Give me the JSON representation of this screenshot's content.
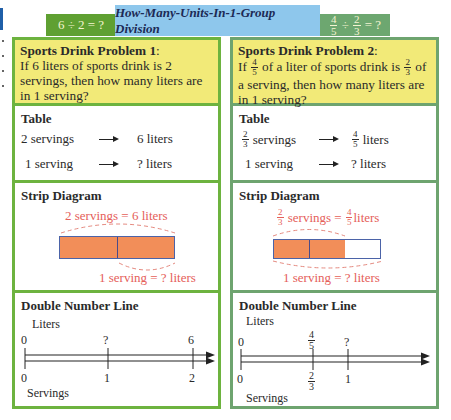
{
  "header": {
    "left_equation": "6 ÷ 2 = ?",
    "title": "How-Many-Units-In-1-Group Division",
    "right_equation": {
      "a_num": "4",
      "a_den": "5",
      "op": "÷",
      "b_num": "2",
      "b_den": "3",
      "tail": "= ?"
    }
  },
  "colors": {
    "left_green": "#5fa032",
    "title_blue": "#8ec7ec",
    "right_green": "#6da770",
    "problem_yellow": "#f2ea78",
    "strip_fill": "#f28e59",
    "label_red": "#e5605a"
  },
  "problem1": {
    "heading": "Sports Drink Problem 1",
    "heading_colon": ":",
    "text": "If 6 liters of sports drink is 2 servings, then how many liters are in 1 serving?",
    "table": {
      "title": "Table",
      "rows": [
        {
          "left": "2 servings",
          "right": "6 liters"
        },
        {
          "left": "1 serving",
          "right": "? liters"
        }
      ]
    },
    "strip": {
      "title": "Strip Diagram",
      "top_label": "2 servings = 6 liters",
      "bottom_label": "1 serving = ? liters",
      "segments_filled": 2,
      "segments_total": 2
    },
    "number_line": {
      "title": "Double Number Line",
      "top_axis_label": "Liters",
      "bottom_axis_label": "Servings",
      "top_ticks": [
        "0",
        "?",
        "6"
      ],
      "bottom_ticks": [
        "0",
        "1",
        "2"
      ]
    }
  },
  "problem2": {
    "heading": "Sports Drink Problem 2",
    "heading_colon": ":",
    "text_parts": [
      "If",
      "4",
      "5",
      "of a liter of sports drink is",
      "2",
      "3",
      "of a serving, then how many liters are in 1 serving?"
    ],
    "table": {
      "title": "Table",
      "rows": [
        {
          "left_num": "2",
          "left_den": "3",
          "left": "servings",
          "right_num": "4",
          "right_den": "5",
          "right": "liters"
        },
        {
          "left": "1 serving",
          "right": "? liters"
        }
      ]
    },
    "strip": {
      "title": "Strip Diagram",
      "top_label_a_num": "2",
      "top_label_a_den": "3",
      "top_label_mid": "servings =",
      "top_label_b_num": "4",
      "top_label_b_den": "5",
      "top_label_tail": "liters",
      "bottom_label": "1 serving = ? liters",
      "segments_filled": 2,
      "segments_total": 3
    },
    "number_line": {
      "title": "Double Number Line",
      "top_axis_label": "Liters",
      "bottom_axis_label": "Servings",
      "top_ticks": [
        "0",
        {
          "num": "4",
          "den": "5"
        },
        "?"
      ],
      "bottom_ticks": [
        "0",
        {
          "num": "2",
          "den": "3"
        },
        "1"
      ],
      "top_tick_mid_num": "4",
      "top_tick_mid_den": "5",
      "bottom_tick_mid_num": "2",
      "bottom_tick_mid_den": "3"
    }
  }
}
